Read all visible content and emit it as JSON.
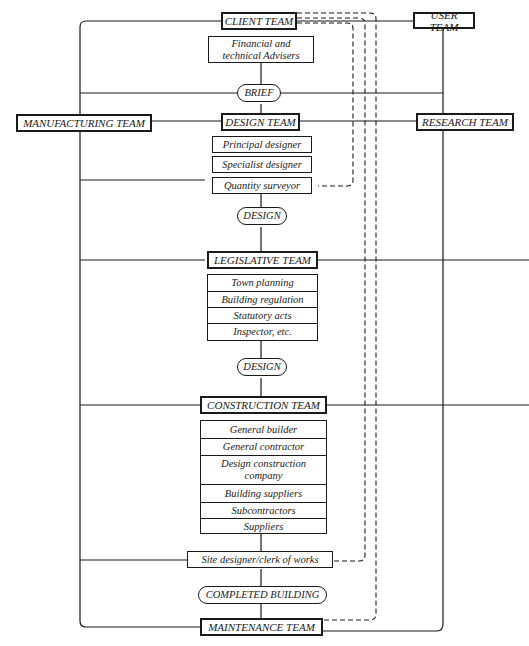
{
  "diagram": {
    "teams": {
      "client": "CLIENT TEAM",
      "user": "USER TEAM",
      "manufacturing": "MANUFACTURING TEAM",
      "design": "DESIGN TEAM",
      "research": "RESEARCH TEAM",
      "legislative": "LEGISLATIVE TEAM",
      "construction": "CONSTRUCTION TEAM",
      "maintenance": "MAINTENANCE TEAM"
    },
    "advisers": "Financial and technical Advisers",
    "stages": {
      "brief": "BRIEF",
      "design1": "DESIGN",
      "design2": "DESIGN",
      "completed": "COMPLETED BUILDING"
    },
    "design_team_members": [
      "Principal designer",
      "Specialist designer",
      "Quantity surveyor"
    ],
    "legislative_items": [
      "Town planning",
      "Building regulation",
      "Statutory acts",
      "Inspector, etc."
    ],
    "construction_items": [
      "General builder",
      "General contractor",
      "Design construction company",
      "Building suppliers",
      "Subcontractors",
      "Suppliers"
    ],
    "site": "Site designer/clerk of works",
    "colors": {
      "line": "#1a1a1a",
      "background": "#ffffff"
    }
  }
}
